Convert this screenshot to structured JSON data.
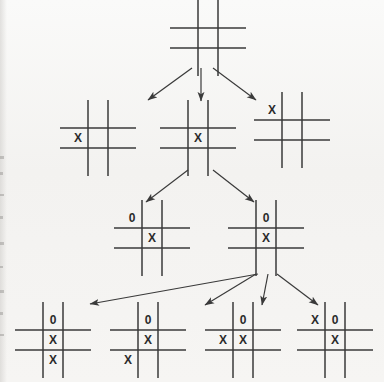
{
  "diagram": {
    "background_color": "#f4f3f1",
    "stroke_color": "#3a3a3a",
    "mark_color": "#2b2b2b",
    "mark_x": "X",
    "mark_o": "0",
    "levels": 4
  },
  "boards": [
    {
      "id": "root",
      "name": "root-empty-board",
      "level": 0,
      "x": 178,
      "y": 8,
      "cell": 20,
      "cells": [
        "",
        "",
        "",
        "",
        "",
        "",
        "",
        "",
        ""
      ]
    },
    {
      "id": "l1-left",
      "name": "level1-board-left",
      "level": 1,
      "x": 68,
      "y": 108,
      "cell": 20,
      "cells": [
        "",
        "",
        "",
        "X",
        "",
        "",
        "",
        "",
        ""
      ]
    },
    {
      "id": "l1-mid",
      "name": "level1-board-middle",
      "level": 1,
      "x": 168,
      "y": 108,
      "cell": 20,
      "cells": [
        "",
        "",
        "",
        "",
        "X",
        "",
        "",
        "",
        ""
      ]
    },
    {
      "id": "l1-right",
      "name": "level1-board-right",
      "level": 1,
      "x": 262,
      "y": 100,
      "cell": 20,
      "cells": [
        "X",
        "",
        "",
        "",
        "",
        "",
        "",
        "",
        ""
      ]
    },
    {
      "id": "l2-left",
      "name": "level2-board-left",
      "level": 2,
      "x": 122,
      "y": 208,
      "cell": 20,
      "cells": [
        "0",
        "",
        "",
        "",
        "X",
        "",
        "",
        "",
        ""
      ]
    },
    {
      "id": "l2-right",
      "name": "level2-board-right",
      "level": 2,
      "x": 236,
      "y": 208,
      "cell": 20,
      "cells": [
        "",
        "0",
        "",
        "",
        "X",
        "",
        "",
        "",
        ""
      ]
    },
    {
      "id": "l3-a",
      "name": "level3-board-1",
      "level": 3,
      "x": 23,
      "y": 310,
      "cell": 20,
      "cells": [
        "",
        "0",
        "",
        "",
        "X",
        "",
        "",
        "X",
        ""
      ]
    },
    {
      "id": "l3-b",
      "name": "level3-board-2",
      "level": 3,
      "x": 118,
      "y": 310,
      "cell": 20,
      "cells": [
        "",
        "0",
        "",
        "",
        "X",
        "",
        "X",
        "",
        ""
      ]
    },
    {
      "id": "l3-c",
      "name": "level3-board-3",
      "level": 3,
      "x": 213,
      "y": 310,
      "cell": 20,
      "cells": [
        "",
        "0",
        "",
        "X",
        "X",
        "",
        "",
        "",
        ""
      ]
    },
    {
      "id": "l3-d",
      "name": "level3-board-4",
      "level": 3,
      "x": 305,
      "y": 310,
      "cell": 20,
      "cells": [
        "X",
        "0",
        "",
        "",
        "X",
        "",
        "",
        "",
        ""
      ]
    }
  ],
  "arrows": [
    {
      "name": "arrow-root-to-left",
      "x1": 192,
      "y1": 68,
      "x2": 148,
      "y2": 100
    },
    {
      "name": "arrow-root-to-middle",
      "x1": 201,
      "y1": 68,
      "x2": 201,
      "y2": 101
    },
    {
      "name": "arrow-root-to-right",
      "x1": 213,
      "y1": 68,
      "x2": 256,
      "y2": 100
    },
    {
      "name": "arrow-middle-to-l2-left",
      "x1": 188,
      "y1": 170,
      "x2": 146,
      "y2": 202
    },
    {
      "name": "arrow-middle-to-l2-right",
      "x1": 213,
      "y1": 170,
      "x2": 254,
      "y2": 202
    },
    {
      "name": "arrow-l2right-to-l3a",
      "x1": 258,
      "y1": 274,
      "x2": 90,
      "y2": 304
    },
    {
      "name": "arrow-l2right-to-l3b",
      "x1": 256,
      "y1": 274,
      "x2": 205,
      "y2": 305
    },
    {
      "name": "arrow-l2right-to-l3c",
      "x1": 268,
      "y1": 274,
      "x2": 262,
      "y2": 305
    },
    {
      "name": "arrow-l2right-to-l3d",
      "x1": 277,
      "y1": 274,
      "x2": 318,
      "y2": 305
    }
  ]
}
